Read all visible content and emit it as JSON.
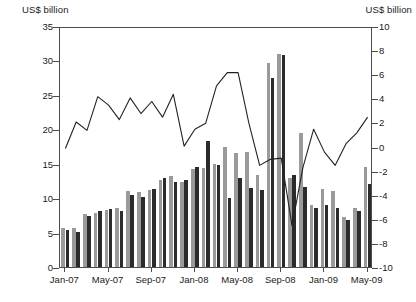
{
  "axes": {
    "left_unit": "US$ billion",
    "right_unit": "US$ billion",
    "left_ticks": [
      "35",
      "30",
      "25",
      "20",
      "15",
      "10",
      "5",
      "0"
    ],
    "right_ticks": [
      "10",
      "8",
      "6",
      "4",
      "2",
      "0",
      "-2",
      "-4",
      "-6",
      "-8",
      "-10"
    ],
    "x_labels": [
      "Jan-07",
      "May-07",
      "Sep-07",
      "Jan-08",
      "May-08",
      "Sep-08",
      "Jan-09",
      "May-09"
    ]
  },
  "legend": {
    "inflows": "Inflows",
    "outflows": "Outflows",
    "net": "Net (right scale)"
  },
  "colors": {
    "inflows": "#9a9a9a",
    "outflows": "#2b2b2b",
    "net": "#222222",
    "axis": "#4d4d4d"
  },
  "chart_data": {
    "type": "bar",
    "title": "",
    "xlabel": "",
    "ylabel": "US$ billion",
    "ylim": [
      0,
      35
    ],
    "y2lim": [
      -10,
      10
    ],
    "y2label": "US$ billion",
    "grid": false,
    "legend_position": "top-left",
    "categories": [
      "Jan-07",
      "Feb-07",
      "Mar-07",
      "Apr-07",
      "May-07",
      "Jun-07",
      "Jul-07",
      "Aug-07",
      "Sep-07",
      "Oct-07",
      "Nov-07",
      "Dec-07",
      "Jan-08",
      "Feb-08",
      "Mar-08",
      "Apr-08",
      "May-08",
      "Jun-08",
      "Jul-08",
      "Aug-08",
      "Sep-08",
      "Oct-08",
      "Nov-08",
      "Dec-08",
      "Jan-09",
      "Feb-09",
      "Mar-09",
      "Apr-09",
      "May-09"
    ],
    "x_tick_indices": [
      0,
      4,
      8,
      12,
      16,
      20,
      24,
      28
    ],
    "series": [
      {
        "name": "Inflows",
        "axis": "left",
        "values": [
          5.6,
          5.6,
          7.7,
          7.8,
          8.3,
          8.5,
          11.0,
          10.9,
          11.2,
          12.6,
          13.2,
          12.4,
          14.3,
          14.4,
          15.0,
          17.4,
          16.5,
          16.7,
          13.4,
          29.7,
          30.9,
          13.0,
          19.4,
          9.0,
          11.3,
          11.0,
          7.2,
          8.5,
          14.5
        ]
      },
      {
        "name": "Outflows",
        "axis": "left",
        "values": [
          5.4,
          5.1,
          7.4,
          8.2,
          8.4,
          8.1,
          10.4,
          10.2,
          11.3,
          12.9,
          12.4,
          12.6,
          14.5,
          18.3,
          14.8,
          10.0,
          12.9,
          11.5,
          11.2,
          27.5,
          30.8,
          13.3,
          11.6,
          8.5,
          9.0,
          8.6,
          6.9,
          8.2,
          12.0
        ]
      },
      {
        "name": "Net (right scale)",
        "axis": "right",
        "values": [
          0.0,
          2.2,
          1.5,
          4.3,
          3.6,
          2.4,
          4.2,
          2.9,
          3.9,
          2.6,
          4.5,
          0.2,
          1.6,
          2.1,
          5.2,
          6.3,
          6.3,
          2.1,
          -1.4,
          -0.9,
          -0.8,
          -6.4,
          -1.6,
          1.6,
          -0.3,
          -1.4,
          0.4,
          1.3,
          2.6
        ]
      }
    ]
  }
}
